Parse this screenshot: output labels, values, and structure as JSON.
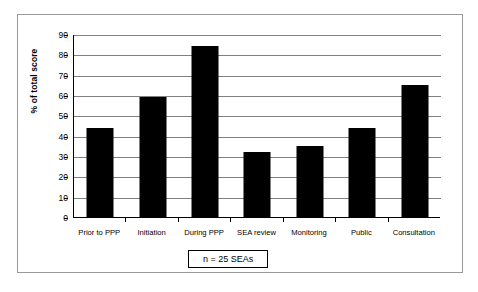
{
  "chart_data": {
    "type": "bar",
    "title": "",
    "subtitle": "",
    "xlabel": "",
    "ylabel": "% of total score",
    "ylim": [
      0,
      90
    ],
    "ytick_step": 10,
    "yticks": [
      90,
      80,
      70,
      60,
      50,
      40,
      30,
      20,
      10,
      0
    ],
    "grid": "horizontal",
    "legend": "none",
    "annotation": "n = 25 SEAs",
    "bar_color": "#000000",
    "categories": [
      "Prior to PPP",
      "Initiation",
      "During PPP",
      "SEA review",
      "Monitoring",
      "Public",
      "Consultation"
    ],
    "values": [
      44,
      59,
      84,
      32,
      35,
      44,
      65
    ],
    "series": [
      {
        "name": "% of total score",
        "values": [
          44,
          59,
          84,
          32,
          35,
          44,
          65
        ]
      }
    ]
  },
  "figure": {
    "annotation_label": "n = 25 SEAs",
    "axis": {
      "y_title": "% of total score"
    }
  }
}
